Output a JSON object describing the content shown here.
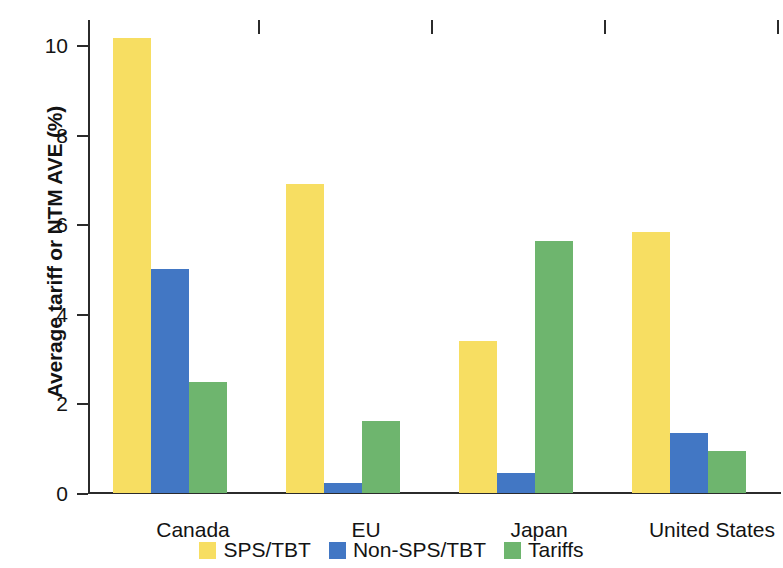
{
  "chart_data": {
    "type": "bar",
    "title": "",
    "xlabel": "",
    "ylabel": "Average tariff or NTM AVE (%)",
    "categories": [
      "Canada",
      "EU",
      "Japan",
      "United States"
    ],
    "series": [
      {
        "name": "SPS/TBT",
        "color": "#F7DE62",
        "values": [
          10.15,
          6.9,
          3.4,
          5.83
        ]
      },
      {
        "name": "Non-SPS/TBT",
        "color": "#4277C4",
        "values": [
          5.0,
          0.22,
          0.45,
          1.35
        ]
      },
      {
        "name": "Tariffs",
        "color": "#6EB56E",
        "values": [
          2.48,
          1.6,
          5.63,
          0.94
        ]
      }
    ],
    "ylim": [
      0,
      10.55
    ],
    "yticks": [
      0,
      2,
      4,
      6,
      8,
      10
    ],
    "ytick_labels": [
      "0",
      "2",
      "4",
      "6",
      "8",
      "10"
    ],
    "grid": false,
    "legend_position": "bottom"
  },
  "axis": {
    "y_title": "Average tariff or NTM AVE (%)",
    "tick_0": "0",
    "tick_2": "2",
    "tick_4": "4",
    "tick_6": "6",
    "tick_8": "8",
    "tick_10": "10"
  },
  "categories": {
    "c0": "Canada",
    "c1": "EU",
    "c2": "Japan",
    "c3": "United States"
  },
  "legend": {
    "items": [
      {
        "label": "SPS/TBT"
      },
      {
        "label": "Non-SPS/TBT"
      },
      {
        "label": "Tariffs"
      }
    ]
  }
}
